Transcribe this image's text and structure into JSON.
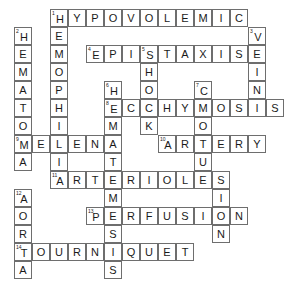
{
  "puzzle": {
    "title": "Crossword Puzzle Grid",
    "grid": {
      "origin_x": 14,
      "origin_y": 9,
      "cell_size": 18,
      "columns": 15,
      "rows": 15
    },
    "colors": {
      "cell_fill": "#ffffff",
      "cell_border": "#6e6e6e",
      "letter": "#1a1a1a",
      "page_background": "#ffffff"
    },
    "entries": [
      {
        "number": "1",
        "direction": "across",
        "answer": "HYPOVOLEMIC",
        "row": 0,
        "col": 2,
        "length": 11
      },
      {
        "number": "1",
        "direction": "down",
        "answer": "HEMOPHILIA",
        "row": 0,
        "col": 2,
        "length": 10
      },
      {
        "number": "2",
        "direction": "down",
        "answer": "HEMATOMA",
        "row": 1,
        "col": 0,
        "length": 8
      },
      {
        "number": "3",
        "direction": "down",
        "answer": "VEINS",
        "row": 1,
        "col": 13,
        "length": 5
      },
      {
        "number": "4",
        "direction": "across",
        "answer": "EPISTAXIS",
        "row": 2,
        "col": 4,
        "length": 9
      },
      {
        "number": "5",
        "direction": "down",
        "answer": "SHOCK",
        "row": 2,
        "col": 7,
        "length": 5
      },
      {
        "number": "6",
        "direction": "down",
        "answer": "HEMATEMESIS",
        "row": 4,
        "col": 5,
        "length": 11
      },
      {
        "number": "7",
        "direction": "down",
        "answer": "CONTUSION",
        "row": 4,
        "col": 10,
        "length": 9
      },
      {
        "number": "8",
        "direction": "across",
        "answer": "ECCHYMOSIS",
        "row": 5,
        "col": 5,
        "length": 10
      },
      {
        "number": "9",
        "direction": "across",
        "answer": "MELENA",
        "row": 7,
        "col": 0,
        "length": 6
      },
      {
        "number": "10",
        "direction": "across",
        "answer": "ARTERY",
        "row": 7,
        "col": 8,
        "length": 6
      },
      {
        "number": "11",
        "direction": "across",
        "answer": "ARTERIOLES",
        "row": 9,
        "col": 2,
        "length": 10
      },
      {
        "number": "12",
        "direction": "down",
        "answer": "AORTA",
        "row": 10,
        "col": 0,
        "length": 5
      },
      {
        "number": "13",
        "direction": "across",
        "answer": "PERFUSION",
        "row": 11,
        "col": 4,
        "length": 9
      },
      {
        "number": "14",
        "direction": "across",
        "answer": "TOURNIQUET",
        "row": 13,
        "col": 0,
        "length": 10
      }
    ],
    "cells": [
      {
        "row": 0,
        "col": 2,
        "letter": "H",
        "number": "1"
      },
      {
        "row": 0,
        "col": 3,
        "letter": "Y",
        "number": ""
      },
      {
        "row": 0,
        "col": 4,
        "letter": "P",
        "number": ""
      },
      {
        "row": 0,
        "col": 5,
        "letter": "O",
        "number": ""
      },
      {
        "row": 0,
        "col": 6,
        "letter": "V",
        "number": ""
      },
      {
        "row": 0,
        "col": 7,
        "letter": "O",
        "number": ""
      },
      {
        "row": 0,
        "col": 8,
        "letter": "L",
        "number": ""
      },
      {
        "row": 0,
        "col": 9,
        "letter": "E",
        "number": ""
      },
      {
        "row": 0,
        "col": 10,
        "letter": "M",
        "number": ""
      },
      {
        "row": 0,
        "col": 11,
        "letter": "I",
        "number": ""
      },
      {
        "row": 0,
        "col": 12,
        "letter": "C",
        "number": ""
      },
      {
        "row": 1,
        "col": 0,
        "letter": "H",
        "number": "2"
      },
      {
        "row": 1,
        "col": 2,
        "letter": "E",
        "number": ""
      },
      {
        "row": 1,
        "col": 13,
        "letter": "V",
        "number": "3"
      },
      {
        "row": 2,
        "col": 0,
        "letter": "E",
        "number": ""
      },
      {
        "row": 2,
        "col": 2,
        "letter": "M",
        "number": ""
      },
      {
        "row": 2,
        "col": 4,
        "letter": "E",
        "number": "4"
      },
      {
        "row": 2,
        "col": 5,
        "letter": "P",
        "number": ""
      },
      {
        "row": 2,
        "col": 6,
        "letter": "I",
        "number": ""
      },
      {
        "row": 2,
        "col": 7,
        "letter": "S",
        "number": "5"
      },
      {
        "row": 2,
        "col": 8,
        "letter": "T",
        "number": ""
      },
      {
        "row": 2,
        "col": 9,
        "letter": "A",
        "number": ""
      },
      {
        "row": 2,
        "col": 10,
        "letter": "X",
        "number": ""
      },
      {
        "row": 2,
        "col": 11,
        "letter": "I",
        "number": ""
      },
      {
        "row": 2,
        "col": 12,
        "letter": "S",
        "number": ""
      },
      {
        "row": 2,
        "col": 13,
        "letter": "E",
        "number": ""
      },
      {
        "row": 3,
        "col": 0,
        "letter": "M",
        "number": ""
      },
      {
        "row": 3,
        "col": 2,
        "letter": "O",
        "number": ""
      },
      {
        "row": 3,
        "col": 7,
        "letter": "H",
        "number": ""
      },
      {
        "row": 3,
        "col": 13,
        "letter": "I",
        "number": ""
      },
      {
        "row": 4,
        "col": 0,
        "letter": "A",
        "number": ""
      },
      {
        "row": 4,
        "col": 2,
        "letter": "P",
        "number": ""
      },
      {
        "row": 4,
        "col": 5,
        "letter": "H",
        "number": "6"
      },
      {
        "row": 4,
        "col": 7,
        "letter": "O",
        "number": ""
      },
      {
        "row": 4,
        "col": 10,
        "letter": "C",
        "number": "7"
      },
      {
        "row": 4,
        "col": 13,
        "letter": "N",
        "number": ""
      },
      {
        "row": 5,
        "col": 0,
        "letter": "T",
        "number": ""
      },
      {
        "row": 5,
        "col": 2,
        "letter": "H",
        "number": ""
      },
      {
        "row": 5,
        "col": 5,
        "letter": "E",
        "number": "8"
      },
      {
        "row": 5,
        "col": 6,
        "letter": "C",
        "number": ""
      },
      {
        "row": 5,
        "col": 7,
        "letter": "C",
        "number": ""
      },
      {
        "row": 5,
        "col": 8,
        "letter": "H",
        "number": ""
      },
      {
        "row": 5,
        "col": 9,
        "letter": "Y",
        "number": ""
      },
      {
        "row": 5,
        "col": 10,
        "letter": "M",
        "number": ""
      },
      {
        "row": 5,
        "col": 11,
        "letter": "O",
        "number": ""
      },
      {
        "row": 5,
        "col": 12,
        "letter": "S",
        "number": ""
      },
      {
        "row": 5,
        "col": 13,
        "letter": "I",
        "number": ""
      },
      {
        "row": 5,
        "col": 14,
        "letter": "S",
        "number": ""
      },
      {
        "row": 6,
        "col": 0,
        "letter": "O",
        "number": ""
      },
      {
        "row": 6,
        "col": 2,
        "letter": "I",
        "number": ""
      },
      {
        "row": 6,
        "col": 5,
        "letter": "M",
        "number": ""
      },
      {
        "row": 6,
        "col": 7,
        "letter": "K",
        "number": ""
      },
      {
        "row": 6,
        "col": 10,
        "letter": "O",
        "number": ""
      },
      {
        "row": 7,
        "col": 0,
        "letter": "M",
        "number": "9"
      },
      {
        "row": 7,
        "col": 1,
        "letter": "E",
        "number": ""
      },
      {
        "row": 7,
        "col": 2,
        "letter": "L",
        "number": ""
      },
      {
        "row": 7,
        "col": 3,
        "letter": "E",
        "number": ""
      },
      {
        "row": 7,
        "col": 4,
        "letter": "N",
        "number": ""
      },
      {
        "row": 7,
        "col": 5,
        "letter": "A",
        "number": ""
      },
      {
        "row": 7,
        "col": 8,
        "letter": "A",
        "number": "10"
      },
      {
        "row": 7,
        "col": 9,
        "letter": "R",
        "number": ""
      },
      {
        "row": 7,
        "col": 10,
        "letter": "T",
        "number": ""
      },
      {
        "row": 7,
        "col": 11,
        "letter": "E",
        "number": ""
      },
      {
        "row": 7,
        "col": 12,
        "letter": "R",
        "number": ""
      },
      {
        "row": 7,
        "col": 13,
        "letter": "Y",
        "number": ""
      },
      {
        "row": 8,
        "col": 0,
        "letter": "A",
        "number": ""
      },
      {
        "row": 8,
        "col": 2,
        "letter": "I",
        "number": ""
      },
      {
        "row": 8,
        "col": 5,
        "letter": "T",
        "number": ""
      },
      {
        "row": 8,
        "col": 10,
        "letter": "U",
        "number": ""
      },
      {
        "row": 9,
        "col": 2,
        "letter": "A",
        "number": "11"
      },
      {
        "row": 9,
        "col": 3,
        "letter": "R",
        "number": ""
      },
      {
        "row": 9,
        "col": 4,
        "letter": "T",
        "number": ""
      },
      {
        "row": 9,
        "col": 5,
        "letter": "E",
        "number": ""
      },
      {
        "row": 9,
        "col": 6,
        "letter": "R",
        "number": ""
      },
      {
        "row": 9,
        "col": 7,
        "letter": "I",
        "number": ""
      },
      {
        "row": 9,
        "col": 8,
        "letter": "O",
        "number": ""
      },
      {
        "row": 9,
        "col": 9,
        "letter": "L",
        "number": ""
      },
      {
        "row": 9,
        "col": 10,
        "letter": "E",
        "number": ""
      },
      {
        "row": 9,
        "col": 11,
        "letter": "S",
        "number": ""
      },
      {
        "row": 10,
        "col": 0,
        "letter": "A",
        "number": "12"
      },
      {
        "row": 10,
        "col": 5,
        "letter": "M",
        "number": ""
      },
      {
        "row": 10,
        "col": 11,
        "letter": "I",
        "number": ""
      },
      {
        "row": 11,
        "col": 0,
        "letter": "O",
        "number": ""
      },
      {
        "row": 11,
        "col": 4,
        "letter": "P",
        "number": "13"
      },
      {
        "row": 11,
        "col": 5,
        "letter": "E",
        "number": ""
      },
      {
        "row": 11,
        "col": 6,
        "letter": "R",
        "number": ""
      },
      {
        "row": 11,
        "col": 7,
        "letter": "F",
        "number": ""
      },
      {
        "row": 11,
        "col": 8,
        "letter": "U",
        "number": ""
      },
      {
        "row": 11,
        "col": 9,
        "letter": "S",
        "number": ""
      },
      {
        "row": 11,
        "col": 10,
        "letter": "I",
        "number": ""
      },
      {
        "row": 11,
        "col": 11,
        "letter": "O",
        "number": ""
      },
      {
        "row": 11,
        "col": 12,
        "letter": "N",
        "number": ""
      },
      {
        "row": 12,
        "col": 0,
        "letter": "R",
        "number": ""
      },
      {
        "row": 12,
        "col": 5,
        "letter": "S",
        "number": ""
      },
      {
        "row": 12,
        "col": 11,
        "letter": "N",
        "number": ""
      },
      {
        "row": 13,
        "col": 0,
        "letter": "T",
        "number": "14"
      },
      {
        "row": 13,
        "col": 1,
        "letter": "O",
        "number": ""
      },
      {
        "row": 13,
        "col": 2,
        "letter": "U",
        "number": ""
      },
      {
        "row": 13,
        "col": 3,
        "letter": "R",
        "number": ""
      },
      {
        "row": 13,
        "col": 4,
        "letter": "N",
        "number": ""
      },
      {
        "row": 13,
        "col": 5,
        "letter": "I",
        "number": ""
      },
      {
        "row": 13,
        "col": 6,
        "letter": "Q",
        "number": ""
      },
      {
        "row": 13,
        "col": 7,
        "letter": "U",
        "number": ""
      },
      {
        "row": 13,
        "col": 8,
        "letter": "E",
        "number": ""
      },
      {
        "row": 13,
        "col": 9,
        "letter": "T",
        "number": ""
      },
      {
        "row": 14,
        "col": 0,
        "letter": "A",
        "number": ""
      },
      {
        "row": 14,
        "col": 5,
        "letter": "S",
        "number": ""
      }
    ]
  }
}
